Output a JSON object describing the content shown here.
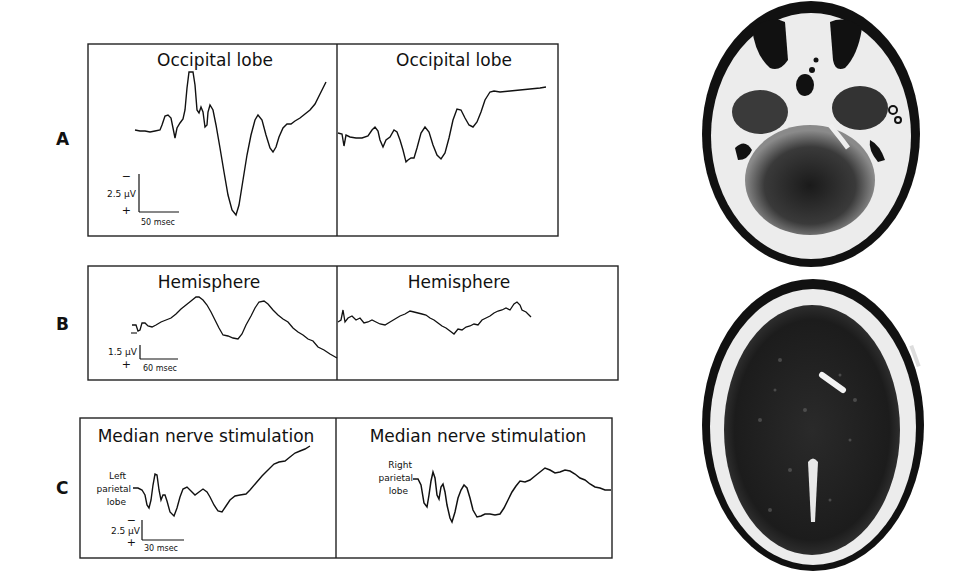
{
  "figure": {
    "rows": [
      {
        "label": "A",
        "panels": [
          {
            "title": "Occipital lobe",
            "side": "left"
          },
          {
            "title": "Occipital lobe",
            "side": "right"
          }
        ],
        "scale": {
          "voltage": "2.5 μV",
          "time": "50 msec",
          "minus": "−",
          "plus": "+"
        }
      },
      {
        "label": "B",
        "panels": [
          {
            "title": "Hemisphere",
            "side": "left"
          },
          {
            "title": "Hemisphere",
            "side": "right"
          }
        ],
        "scale": {
          "voltage": "1.5 μV",
          "time": "60 msec",
          "minus": "−",
          "plus": "+"
        }
      },
      {
        "label": "C",
        "panels": [
          {
            "title": "Median nerve stimulation",
            "side": "left",
            "annotation": [
              "Left",
              "parietal",
              "lobe"
            ]
          },
          {
            "title": "Median nerve stimulation",
            "side": "right",
            "annotation": [
              "Right",
              "parietal",
              "lobe"
            ]
          }
        ],
        "scale": {
          "voltage": "2.5 μV",
          "time": "30 msec",
          "minus": "−",
          "plus": "+"
        }
      }
    ],
    "images": [
      {
        "name": "ct-scan-posterior-fossa",
        "description": "Axial CT slice at level of posterior fossa"
      },
      {
        "name": "ct-scan-supratentorial",
        "description": "Axial CT slice at level of lateral ventricles"
      }
    ]
  },
  "colors": {
    "ink": "#111111",
    "background": "#ffffff",
    "ct_bright": "#eeeeee",
    "ct_dark": "#141414"
  }
}
